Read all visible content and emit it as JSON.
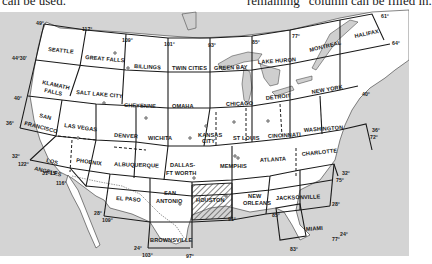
{
  "page_text": {
    "top_left": "can be used.",
    "top_right": "remaining “column can be filled in."
  },
  "map": {
    "title": "Sectional aeronautical chart coverage of the United States",
    "colors": {
      "land": "#ffffff",
      "water": "#cfcfcf",
      "grid": "#1a1a1a",
      "hatch": "#555555"
    },
    "sections": [
      {
        "name": "SEATTLE"
      },
      {
        "name": "GREAT FALLS"
      },
      {
        "name": "BILLINGS"
      },
      {
        "name": "TWIN CITIES"
      },
      {
        "name": "GREEN BAY"
      },
      {
        "name": "LAKE HURON"
      },
      {
        "name": "MONTREAL"
      },
      {
        "name": "HALIFAX"
      },
      {
        "name": "KLAMATH FALLS"
      },
      {
        "name": "SALT LAKE CITY"
      },
      {
        "name": "CHEYENNE"
      },
      {
        "name": "OMAHA"
      },
      {
        "name": "CHICAGO"
      },
      {
        "name": "DETROIT"
      },
      {
        "name": "NEW YORK"
      },
      {
        "name": "SAN FRANCISCO"
      },
      {
        "name": "LAS VEGAS"
      },
      {
        "name": "DENVER"
      },
      {
        "name": "WICHITA"
      },
      {
        "name": "KANSAS CITY"
      },
      {
        "name": "ST LOUIS"
      },
      {
        "name": "CINCINNATI"
      },
      {
        "name": "WASHINGTON"
      },
      {
        "name": "LOS ANGELES"
      },
      {
        "name": "PHOENIX"
      },
      {
        "name": "ALBUQUERQUE"
      },
      {
        "name": "DALLAS-FT WORTH"
      },
      {
        "name": "MEMPHIS"
      },
      {
        "name": "ATLANTA"
      },
      {
        "name": "CHARLOTTE"
      },
      {
        "name": "EL PASO"
      },
      {
        "name": "SAN ANTONIO"
      },
      {
        "name": "HOUSTON",
        "highlighted": true
      },
      {
        "name": "NEW ORLEANS"
      },
      {
        "name": "JACKSONVILLE"
      },
      {
        "name": "BROWNSVILLE"
      },
      {
        "name": "MIAMI"
      }
    ],
    "labels": {
      "seattle": "SEATTLE",
      "great_falls": "GREAT FALLS",
      "billings": "BILLINGS",
      "twin_cities": "TWIN CITIES",
      "green_bay": "GREEN BAY",
      "lake_huron": "LAKE HURON",
      "montreal": "MONTREAL",
      "halifax": "HALIFAX",
      "klamath_1": "KLAMATH",
      "klamath_2": "FALLS",
      "salt_lake": "SALT LAKE CITY",
      "cheyenne": "CHEYENNE",
      "omaha": "OMAHA",
      "chicago": "CHICAGO",
      "detroit": "DETROIT",
      "new_york": "NEW YORK",
      "sf_1": "SAN",
      "sf_2": "FRANCISCO",
      "las_vegas": "LAS VEGAS",
      "denver": "DENVER",
      "wichita": "WICHITA",
      "kc_1": "KANSAS",
      "kc_2": "CITY",
      "st": "ST",
      "louis": "LOUIS",
      "cincinnati": "CINCINNATI",
      "washington": "WASHINGTON",
      "la_1": "LOS",
      "la_2": "ANGELES",
      "phoenix": "PHOENIX",
      "albuquerque": "ALBUQUERQUE",
      "dallas_1": "DALLAS-",
      "dallas_2": "FT WORTH",
      "memphis": "MEMPHIS",
      "atlanta": "ATLANTA",
      "charlotte": "CHARLOTTE",
      "el_paso": "EL PASO",
      "sa_1": "SAN",
      "sa_2": "ANTONIO",
      "houston": "HOUSTON",
      "no_1": "NEW",
      "no_2": "ORLEANS",
      "jacksonville": "JACKSONVILLE",
      "brownsville": "BROWNSVILLE",
      "miami": "MIAMI"
    },
    "degrees": {
      "d49": "49°",
      "d117": "117°",
      "d109_top": "109°",
      "d101": "101°",
      "d93": "93°",
      "d85_top": "85°",
      "d77": "77°",
      "d61": "61°",
      "d64": "64°",
      "d44_30": "44°30'",
      "d40_left": "40°",
      "d40_right": "40°",
      "d36_left": "36°",
      "d36_right": "36°",
      "d72": "72°",
      "d32_left": "32°",
      "d122": "122°",
      "d31_15": "31°15'",
      "d116": "116°",
      "d32_right": "32°",
      "d75": "75°",
      "d28_left": "28°",
      "d109_bottom": "109°",
      "d28_right": "28°",
      "d91": "91°",
      "d85_bottom": "85°",
      "d24_left": "24°",
      "d103": "103°",
      "d97": "97°",
      "d24_right": "24°",
      "d77_bottom": "77°",
      "d83": "83°"
    }
  }
}
